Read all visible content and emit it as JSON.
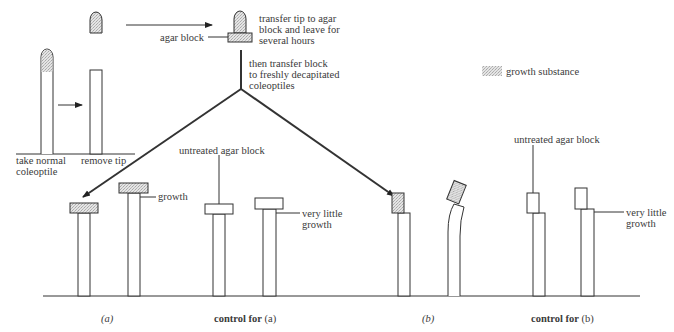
{
  "legend": {
    "swatch": "stippled-pattern",
    "label": "growth substance"
  },
  "steps": {
    "take_normal": [
      "take normal",
      "coleoptile"
    ],
    "remove_tip": "remove tip",
    "agar_block": "agar block",
    "transfer_tip": [
      "transfer tip to agar",
      "block and leave for",
      "several hours"
    ],
    "transfer_block": [
      "then transfer block",
      "to freshly decapitated",
      "coleoptiles"
    ]
  },
  "panels": {
    "a": {
      "caption": "(a)",
      "annotation": "growth"
    },
    "control_a": {
      "caption_bold": "control for",
      "caption_paren": "(a)",
      "block_label": "untreated agar block",
      "annotation": [
        "very little",
        "growth"
      ]
    },
    "b": {
      "caption": "(b)"
    },
    "control_b": {
      "caption_bold": "control for",
      "caption_paren": "(b)",
      "block_label": "untreated agar block",
      "annotation": [
        "very little",
        "growth"
      ]
    }
  },
  "colors": {
    "line": "#333333",
    "stipple": "#cfcfcf",
    "background": "#ffffff"
  }
}
